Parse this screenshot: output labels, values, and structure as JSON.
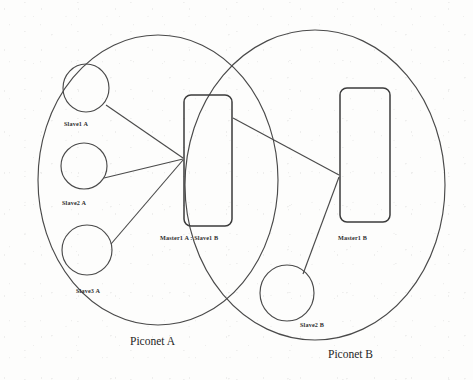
{
  "diagram": {
    "type": "network-diagram",
    "background_color": "#fdfdfc",
    "stroke_color": "#4a4a4a",
    "piconets": [
      {
        "id": "piconet-a",
        "label": "Piconet A",
        "label_x": 130,
        "label_y": 345,
        "ellipse": {
          "cx": 158,
          "cy": 180,
          "rx": 120,
          "ry": 145
        }
      },
      {
        "id": "piconet-b",
        "label": "Piconet B",
        "label_x": 328,
        "label_y": 358,
        "ellipse": {
          "cx": 315,
          "cy": 185,
          "rx": 130,
          "ry": 155
        }
      }
    ],
    "slaves": [
      {
        "id": "slave1-a",
        "label": "Slave1 A",
        "cx": 86,
        "cy": 88,
        "rx": 23,
        "ry": 24,
        "label_x": 64,
        "label_y": 126
      },
      {
        "id": "slave2-a",
        "label": "Slave2 A",
        "cx": 84,
        "cy": 166,
        "rx": 23,
        "ry": 23,
        "label_x": 62,
        "label_y": 205
      },
      {
        "id": "slave3-a",
        "label": "Slave3 A",
        "cx": 87,
        "cy": 250,
        "rx": 25,
        "ry": 25,
        "label_x": 76,
        "label_y": 293
      },
      {
        "id": "slave2-b",
        "label": "Slave2 B",
        "cx": 287,
        "cy": 293,
        "rx": 27,
        "ry": 28,
        "label_x": 300,
        "label_y": 327
      }
    ],
    "masters": [
      {
        "id": "master1-a-slave1-b",
        "label": "Master1 A : Slave1 B",
        "x": 184,
        "y": 95,
        "width": 48,
        "height": 131,
        "rx": 7,
        "label_x": 160,
        "label_y": 240
      },
      {
        "id": "master1-b",
        "label": "Master1 B",
        "x": 340,
        "y": 88,
        "width": 50,
        "height": 134,
        "rx": 7,
        "label_x": 338,
        "label_y": 240
      }
    ],
    "links": [
      {
        "id": "link-slave1a-master1a",
        "from": "slave1-a",
        "to": "master1-a-slave1-b",
        "x1": 106,
        "y1": 105,
        "x2": 183,
        "y2": 158
      },
      {
        "id": "link-slave2a-master1a",
        "from": "slave2-a",
        "to": "master1-a-slave1-b",
        "x1": 104,
        "y1": 178,
        "x2": 183,
        "y2": 159
      },
      {
        "id": "link-slave3a-master1a",
        "from": "slave3-a",
        "to": "master1-a-slave1-b",
        "x1": 111,
        "y1": 244,
        "x2": 183,
        "y2": 160
      },
      {
        "id": "link-master1a-master1b",
        "from": "master1-a-slave1-b",
        "to": "master1-b",
        "x1": 233,
        "y1": 118,
        "x2": 339,
        "y2": 175
      },
      {
        "id": "link-slave2b-master1b",
        "from": "slave2-b",
        "to": "master1-b",
        "x1": 303,
        "y1": 274,
        "x2": 339,
        "y2": 177
      }
    ]
  }
}
